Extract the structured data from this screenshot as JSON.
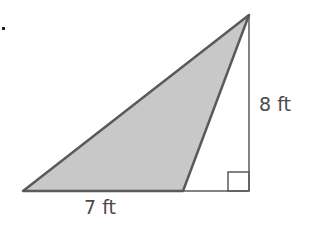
{
  "figure": {
    "shape": "triangle within right triangle",
    "height_label": "8 ft",
    "base_label": "7 ft",
    "shaded_region": "obtuse triangle",
    "right_angle_marker": true,
    "bullet": "."
  },
  "colors": {
    "stroke": "#5a5a5a",
    "fill_shaded": "#c8c8c8",
    "text": "#4a4a4a"
  }
}
